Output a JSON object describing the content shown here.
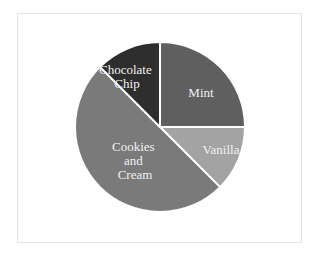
{
  "chart_data": {
    "type": "pie",
    "title": "",
    "categories": [
      "Mint",
      "Vanilla",
      "Cookies and Cream",
      "Chocolate Chip"
    ],
    "values": [
      25,
      12.5,
      50,
      12.5
    ],
    "unit": "percent",
    "start_angle": "12 o'clock, clockwise",
    "colors": [
      "#5f5f5f",
      "#a3a3a3",
      "#7a7a7a",
      "#2e2e2e"
    ],
    "slice_separator_color": "#ffffff",
    "legend": "none (labels on slices)",
    "labels": {
      "mint": [
        "Mint"
      ],
      "vanilla": [
        "Vanilla"
      ],
      "cookies_and_cream": [
        "Cookies",
        "and",
        "Cream"
      ],
      "chocolate_chip": [
        "Chocolate",
        "Chip"
      ]
    }
  },
  "frame": {
    "border_color": "#e4e4e4",
    "background": "#ffffff"
  }
}
